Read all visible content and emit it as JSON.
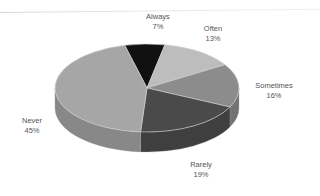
{
  "chart_data": {
    "type": "pie",
    "style": "3d",
    "title": "",
    "slices": [
      {
        "label": "Always",
        "value": 7,
        "display": "7%",
        "color": "#111111"
      },
      {
        "label": "Often",
        "value": 13,
        "display": "13%",
        "color": "#bdbdbd"
      },
      {
        "label": "Sometimes",
        "value": 16,
        "display": "16%",
        "color": "#8c8c8c"
      },
      {
        "label": "Rarely",
        "value": 19,
        "display": "19%",
        "color": "#4a4a4a"
      },
      {
        "label": "Never",
        "value": 45,
        "display": "45%",
        "color": "#a6a6a6"
      }
    ],
    "legend": "none",
    "labels_position": "outside"
  }
}
